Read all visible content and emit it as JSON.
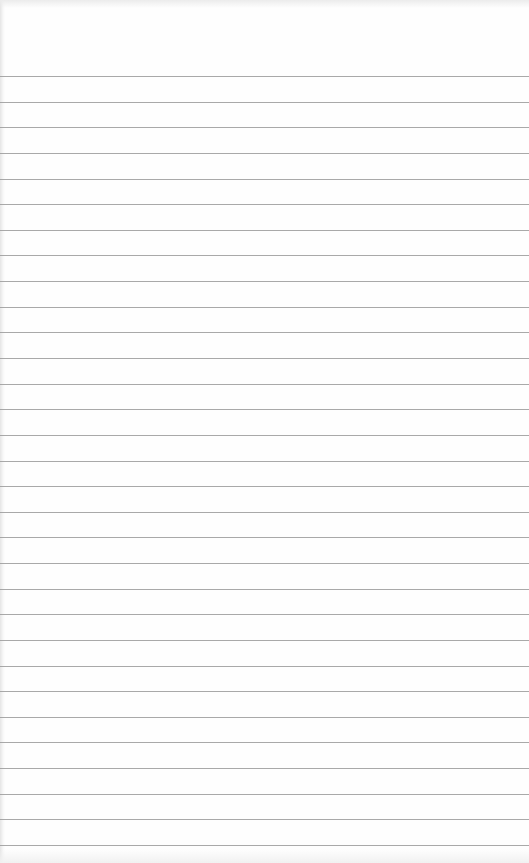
{
  "paper": {
    "type": "lined-paper",
    "background_color": "#fefefe",
    "rule_color": "#9a9a9a",
    "rule_count": 31,
    "text": ""
  }
}
